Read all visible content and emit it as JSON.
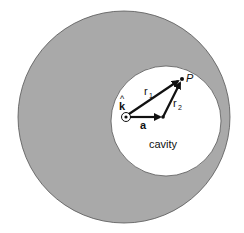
{
  "figure": {
    "labels": {
      "r1": "r",
      "r1_sub": "1",
      "r2": "r",
      "r2_sub": "2",
      "a": "a",
      "k": "k",
      "k_hat": "^",
      "P": "P",
      "cavity": "cavity"
    },
    "colors": {
      "conductor_fill": "#a9a9a9",
      "cavity_fill": "#ffffff",
      "vector": "#111111",
      "outline": "#555555"
    }
  }
}
